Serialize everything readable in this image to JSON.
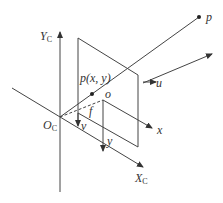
{
  "diagram": {
    "labels": {
      "camera_y_axis": "Y",
      "camera_y_axis_sub": "C",
      "camera_x_axis": "X",
      "camera_x_axis_sub": "C",
      "camera_origin": "O",
      "camera_origin_sub": "C",
      "world_point": "p",
      "image_point": "p(x,  y)",
      "principal_point": "o",
      "focal_length": "f",
      "image_x_axis": "x",
      "image_y_axis": "y",
      "pixel_u_axis": "u",
      "pixel_v_axis": "v"
    },
    "colors": {
      "line": "#444444",
      "text": "#333333",
      "background": "#ffffff"
    }
  }
}
